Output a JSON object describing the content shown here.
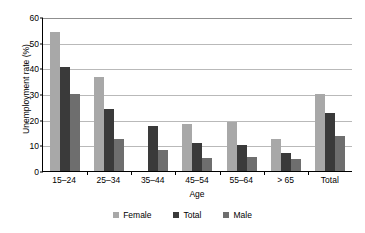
{
  "chart_data": {
    "type": "bar",
    "title": "",
    "xlabel": "Age",
    "ylabel": "Unemployment rate (%)",
    "categories": [
      "15–24",
      "25–34",
      "35–44",
      "45–54",
      "55–64",
      "> 65",
      "Total"
    ],
    "series": [
      {
        "name": "Female",
        "color": "#a8a8a8",
        "values": [
          54.2,
          36.5,
          null,
          18.5,
          19.0,
          12.4,
          30.0
        ]
      },
      {
        "name": "Total",
        "color": "#3a3a3a",
        "values": [
          40.6,
          24.0,
          17.6,
          11.1,
          10.2,
          7.2,
          22.5
        ]
      },
      {
        "name": "Male",
        "color": "#6e6e6e",
        "values": [
          29.9,
          12.5,
          8.2,
          5.1,
          5.5,
          4.6,
          13.7
        ]
      }
    ],
    "ylim": [
      0,
      60
    ],
    "yticks": [
      0,
      10,
      20,
      30,
      40,
      50,
      60
    ],
    "ytick_labels": [
      "0",
      "10",
      "20",
      "30",
      "40",
      "50",
      "60"
    ],
    "grid": true,
    "grid_axis": "y",
    "legend_position": "bottom",
    "legend_orientation": "horizontal"
  }
}
